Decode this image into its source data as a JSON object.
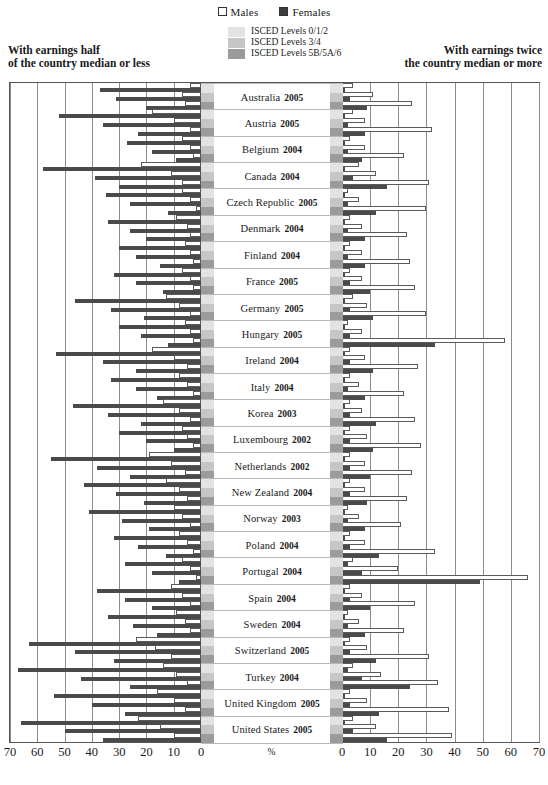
{
  "legend": {
    "males": "Males",
    "females": "Females",
    "isced": [
      {
        "label": "ISCED Levels 0/1/2",
        "color": "#e3e3e3"
      },
      {
        "label": "ISCED Levels 3/4",
        "color": "#c6c6c6"
      },
      {
        "label": "ISCED Levels 5B/5A/6",
        "color": "#9b9b9b"
      }
    ]
  },
  "captions": {
    "left_line1": "With earnings half",
    "left_line2": "of the country median or less",
    "right_line1": "With earnings twice",
    "right_line2": "the country median or more"
  },
  "axis": {
    "unit": "%",
    "left_ticks": [
      70,
      60,
      50,
      40,
      30,
      20,
      10,
      0
    ],
    "right_ticks": [
      0,
      10,
      20,
      30,
      40,
      50,
      60,
      70
    ],
    "max": 70
  },
  "chart_data": {
    "type": "bar",
    "title": "",
    "xlabel": "%",
    "ylabel": "",
    "xlim": [
      0,
      70
    ],
    "grid": true,
    "legend_position": "top-center",
    "orientation": "horizontal-diverging",
    "panels": [
      {
        "name": "left",
        "description": "With earnings half of the country median or less"
      },
      {
        "name": "right",
        "description": "With earnings twice the country median or more"
      }
    ],
    "education_levels": [
      "ISCED Levels 0/1/2",
      "ISCED Levels 3/4",
      "ISCED Levels 5B/5A/6"
    ],
    "series": [
      "Males",
      "Females"
    ],
    "categories": [
      "Australia 2005",
      "Austria 2005",
      "Belgium 2004",
      "Canada 2004",
      "Czech Republic 2005",
      "Denmark 2004",
      "Finland 2004",
      "France 2005",
      "Germany 2005",
      "Hungary 2005",
      "Ireland 2004",
      "Italy 2004",
      "Korea 2003",
      "Luxembourg 2002",
      "Netherlands 2002",
      "New Zealand 2004",
      "Norway 2003",
      "Poland 2004",
      "Portugal 2004",
      "Spain 2004",
      "Sweden 2004",
      "Switzerland 2005",
      "Turkey 2004",
      "United Kingdom 2005",
      "United States 2005"
    ],
    "rows": [
      {
        "country": "Australia",
        "year": "2005",
        "left": {
          "males": [
            4,
            7,
            6
          ],
          "females": [
            37,
            31,
            20
          ]
        },
        "right": {
          "males": [
            4,
            11,
            25
          ],
          "females": [
            1,
            3,
            9
          ]
        }
      },
      {
        "country": "Austria",
        "year": "2005",
        "left": {
          "males": [
            18,
            10,
            4
          ],
          "females": [
            52,
            36,
            23
          ]
        },
        "right": {
          "males": [
            4,
            8,
            32
          ],
          "females": [
            1,
            2,
            8
          ]
        }
      },
      {
        "country": "Belgium",
        "year": "2004",
        "left": {
          "males": [
            7,
            4,
            3
          ],
          "females": [
            27,
            18,
            9
          ]
        },
        "right": {
          "males": [
            3,
            8,
            22
          ],
          "females": [
            1,
            2,
            7
          ]
        }
      },
      {
        "country": "Canada",
        "year": "2004",
        "left": {
          "males": [
            22,
            11,
            7
          ],
          "females": [
            58,
            39,
            30
          ]
        },
        "right": {
          "males": [
            6,
            12,
            31
          ],
          "females": [
            1,
            4,
            16
          ]
        }
      },
      {
        "country": "Czech Republic",
        "year": "2005",
        "left": {
          "males": [
            7,
            4,
            2
          ],
          "females": [
            35,
            26,
            12
          ]
        },
        "right": {
          "males": [
            2,
            6,
            30
          ],
          "females": [
            1,
            2,
            12
          ]
        }
      },
      {
        "country": "Denmark",
        "year": "2004",
        "left": {
          "males": [
            9,
            5,
            4
          ],
          "females": [
            34,
            26,
            20
          ]
        },
        "right": {
          "males": [
            3,
            7,
            23
          ],
          "females": [
            1,
            2,
            8
          ]
        }
      },
      {
        "country": "Finland",
        "year": "2004",
        "left": {
          "males": [
            6,
            4,
            3
          ],
          "females": [
            30,
            24,
            15
          ]
        },
        "right": {
          "males": [
            3,
            7,
            24
          ],
          "females": [
            1,
            2,
            8
          ]
        }
      },
      {
        "country": "France",
        "year": "2005",
        "left": {
          "males": [
            7,
            4,
            3
          ],
          "females": [
            32,
            24,
            14
          ]
        },
        "right": {
          "males": [
            3,
            7,
            26
          ],
          "females": [
            1,
            3,
            10
          ]
        }
      },
      {
        "country": "Germany",
        "year": "2005",
        "left": {
          "males": [
            13,
            8,
            4
          ],
          "females": [
            46,
            33,
            21
          ]
        },
        "right": {
          "males": [
            4,
            9,
            30
          ],
          "females": [
            1,
            3,
            11
          ]
        }
      },
      {
        "country": "Hungary",
        "year": "2005",
        "left": {
          "males": [
            6,
            4,
            3
          ],
          "females": [
            30,
            22,
            12
          ]
        },
        "right": {
          "males": [
            2,
            7,
            58
          ],
          "females": [
            1,
            3,
            33
          ]
        }
      },
      {
        "country": "Ireland",
        "year": "2004",
        "left": {
          "males": [
            18,
            10,
            5
          ],
          "females": [
            53,
            36,
            24
          ]
        },
        "right": {
          "males": [
            3,
            8,
            27
          ],
          "females": [
            1,
            3,
            11
          ]
        }
      },
      {
        "country": "Italy",
        "year": "2004",
        "left": {
          "males": [
            8,
            5,
            3
          ],
          "females": [
            33,
            24,
            16
          ]
        },
        "right": {
          "males": [
            3,
            6,
            22
          ],
          "females": [
            1,
            2,
            8
          ]
        }
      },
      {
        "country": "Korea",
        "year": "2003",
        "left": {
          "males": [
            14,
            8,
            4
          ],
          "females": [
            47,
            34,
            22
          ]
        },
        "right": {
          "males": [
            3,
            7,
            26
          ],
          "females": [
            1,
            3,
            12
          ]
        }
      },
      {
        "country": "Luxembourg",
        "year": "2002",
        "left": {
          "males": [
            7,
            5,
            3
          ],
          "females": [
            30,
            20,
            10
          ]
        },
        "right": {
          "males": [
            3,
            9,
            28
          ],
          "females": [
            1,
            3,
            11
          ]
        }
      },
      {
        "country": "Netherlands",
        "year": "2002",
        "left": {
          "males": [
            19,
            11,
            6
          ],
          "females": [
            55,
            38,
            26
          ]
        },
        "right": {
          "males": [
            3,
            8,
            25
          ],
          "females": [
            1,
            3,
            10
          ]
        }
      },
      {
        "country": "New Zealand",
        "year": "2004",
        "left": {
          "males": [
            13,
            8,
            5
          ],
          "females": [
            43,
            31,
            21
          ]
        },
        "right": {
          "males": [
            3,
            8,
            23
          ],
          "females": [
            1,
            3,
            9
          ]
        }
      },
      {
        "country": "Norway",
        "year": "2003",
        "left": {
          "males": [
            10,
            7,
            4
          ],
          "females": [
            41,
            29,
            19
          ]
        },
        "right": {
          "males": [
            2,
            6,
            21
          ],
          "females": [
            1,
            2,
            8
          ]
        }
      },
      {
        "country": "Poland",
        "year": "2004",
        "left": {
          "males": [
            8,
            5,
            3
          ],
          "females": [
            32,
            23,
            13
          ]
        },
        "right": {
          "males": [
            3,
            8,
            33
          ],
          "females": [
            1,
            3,
            13
          ]
        }
      },
      {
        "country": "Portugal",
        "year": "2004",
        "left": {
          "males": [
            7,
            4,
            2
          ],
          "females": [
            28,
            18,
            8
          ]
        },
        "right": {
          "males": [
            4,
            20,
            66
          ],
          "females": [
            2,
            7,
            49
          ]
        }
      },
      {
        "country": "Spain",
        "year": "2004",
        "left": {
          "males": [
            11,
            7,
            4
          ],
          "females": [
            38,
            28,
            18
          ]
        },
        "right": {
          "males": [
            3,
            7,
            26
          ],
          "females": [
            1,
            3,
            10
          ]
        }
      },
      {
        "country": "Sweden",
        "year": "2004",
        "left": {
          "males": [
            9,
            6,
            4
          ],
          "females": [
            34,
            25,
            16
          ]
        },
        "right": {
          "males": [
            2,
            6,
            22
          ],
          "females": [
            1,
            2,
            8
          ]
        }
      },
      {
        "country": "Switzerland",
        "year": "2005",
        "left": {
          "males": [
            24,
            17,
            11
          ],
          "females": [
            63,
            46,
            32
          ]
        },
        "right": {
          "males": [
            3,
            9,
            31
          ],
          "females": [
            1,
            3,
            12
          ]
        }
      },
      {
        "country": "Turkey",
        "year": "2004",
        "left": {
          "males": [
            14,
            9,
            5
          ],
          "females": [
            67,
            44,
            26
          ]
        },
        "right": {
          "males": [
            4,
            14,
            34
          ],
          "females": [
            2,
            7,
            24
          ]
        }
      },
      {
        "country": "United Kingdom",
        "year": "2005",
        "left": {
          "males": [
            16,
            10,
            6
          ],
          "females": [
            54,
            40,
            28
          ]
        },
        "right": {
          "males": [
            3,
            9,
            38
          ],
          "females": [
            1,
            3,
            13
          ]
        }
      },
      {
        "country": "United States",
        "year": "2005",
        "left": {
          "males": [
            23,
            15,
            10
          ],
          "females": [
            66,
            50,
            36
          ]
        },
        "right": {
          "males": [
            4,
            12,
            39
          ],
          "females": [
            1,
            4,
            16
          ]
        }
      }
    ]
  }
}
